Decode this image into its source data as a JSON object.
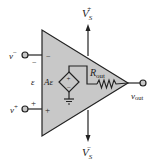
{
  "diagram": {
    "colors": {
      "body_fill": "#c8c8c8",
      "stroke": "#222222",
      "background": "#ffffff"
    },
    "supply": {
      "positive": {
        "base": "V",
        "sub": "S",
        "sup": "+"
      },
      "negative": {
        "base": "V",
        "sub": "S",
        "sup": "−"
      }
    },
    "inputs": {
      "inverting": {
        "base": "v",
        "sup": "−",
        "inner_sign": "−",
        "outer_sign": "−"
      },
      "noninverting": {
        "base": "v",
        "sup": "+",
        "inner_sign": "+",
        "outer_sign": "+"
      }
    },
    "differential_voltage_label": "ε",
    "source": {
      "gain_label": "Aε",
      "polarity_top": "+",
      "polarity_bottom": "−"
    },
    "resistor": {
      "base": "R",
      "sub": "out"
    },
    "output": {
      "base": "v",
      "sub": "out"
    }
  }
}
